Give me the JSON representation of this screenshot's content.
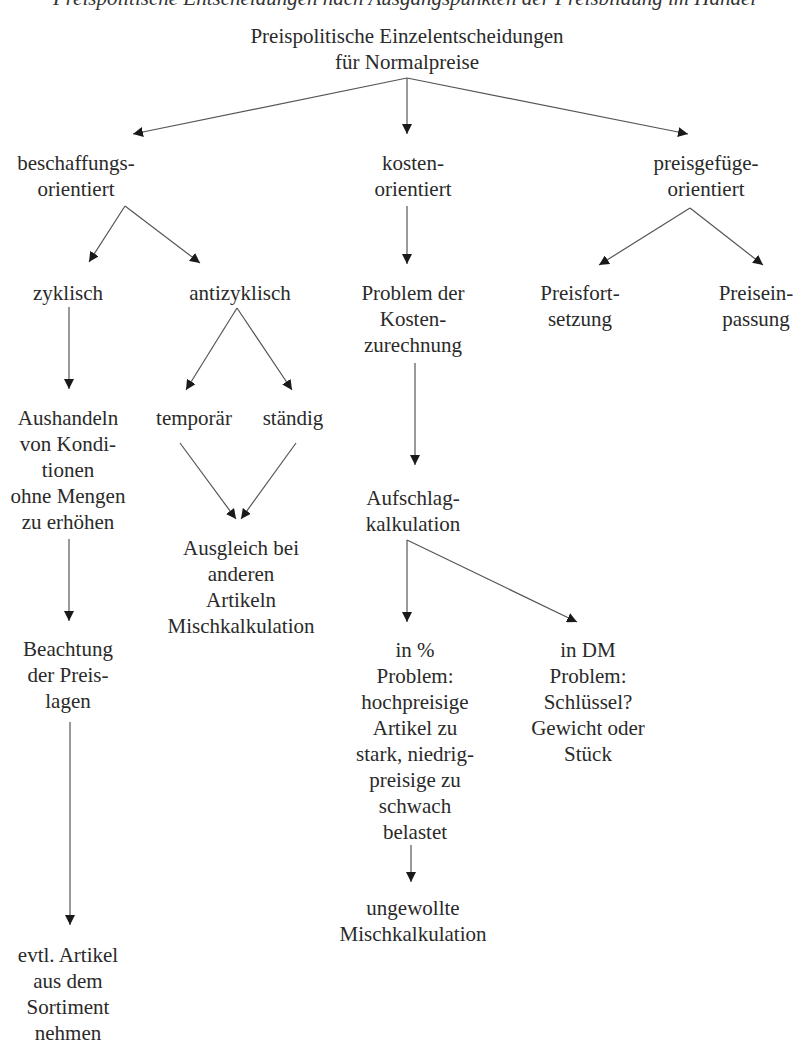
{
  "caption": "Preispolitische Entscheidungen nach Ausgangspunkten der Preisbildung im Handel",
  "root": {
    "lines": [
      "Preispolitische Einzelentscheidungen",
      "für Normalpreise"
    ]
  },
  "nodes": {
    "beschaffung": {
      "lines": [
        "beschaffungs-",
        "orientiert"
      ]
    },
    "kosten": {
      "lines": [
        "kosten-",
        "orientiert"
      ]
    },
    "preisgefuege": {
      "lines": [
        "preisgefüge-",
        "orientiert"
      ]
    },
    "zyklisch": {
      "lines": [
        "zyklisch"
      ]
    },
    "antizyklisch": {
      "lines": [
        "antizyklisch"
      ]
    },
    "problem_kosten": {
      "lines": [
        "Problem der",
        "Kosten-",
        "zurechnung"
      ]
    },
    "preisfortsetzung": {
      "lines": [
        "Preisfort-",
        "setzung"
      ]
    },
    "preiseinpassung": {
      "lines": [
        "Preisein-",
        "passung"
      ]
    },
    "aushandeln": {
      "lines": [
        "Aushandeln",
        "von Kondi-",
        "tionen",
        "ohne Mengen",
        "zu erhöhen"
      ]
    },
    "temporaer": {
      "lines": [
        "temporär"
      ]
    },
    "staendig": {
      "lines": [
        "ständig"
      ]
    },
    "aufschlag": {
      "lines": [
        "Aufschlag-",
        "kalkulation"
      ]
    },
    "ausgleich": {
      "lines": [
        "Ausgleich bei",
        "anderen",
        "Artikeln",
        "Mischkalkulation"
      ]
    },
    "beachtung": {
      "lines": [
        "Beachtung",
        "der Preis-",
        "lagen"
      ]
    },
    "in_prozent": {
      "lines": [
        "in %",
        "Problem:",
        "hochpreisige",
        "Artikel zu",
        "stark, niedrig-",
        "preisige zu",
        "schwach",
        "belastet"
      ]
    },
    "in_dm": {
      "lines": [
        "in DM",
        "Problem:",
        "Schlüssel?",
        "Gewicht oder",
        "Stück"
      ]
    },
    "ungewollte": {
      "lines": [
        "ungewollte",
        "Mischkalkulation"
      ]
    },
    "evtl": {
      "lines": [
        "evtl. Artikel",
        "aus dem",
        "Sortiment",
        "nehmen"
      ]
    }
  },
  "edges": [
    {
      "from": "root",
      "to": "beschaffung"
    },
    {
      "from": "root",
      "to": "kosten"
    },
    {
      "from": "root",
      "to": "preisgefuege"
    },
    {
      "from": "beschaffung",
      "to": "zyklisch"
    },
    {
      "from": "beschaffung",
      "to": "antizyklisch"
    },
    {
      "from": "kosten",
      "to": "problem_kosten"
    },
    {
      "from": "preisgefuege",
      "to": "preisfortsetzung"
    },
    {
      "from": "preisgefuege",
      "to": "preiseinpassung"
    },
    {
      "from": "zyklisch",
      "to": "aushandeln"
    },
    {
      "from": "antizyklisch",
      "to": "temporaer"
    },
    {
      "from": "antizyklisch",
      "to": "staendig"
    },
    {
      "from": "problem_kosten",
      "to": "aufschlag"
    },
    {
      "from": "temporaer",
      "to": "ausgleich"
    },
    {
      "from": "staendig",
      "to": "ausgleich"
    },
    {
      "from": "aushandeln",
      "to": "beachtung"
    },
    {
      "from": "aufschlag",
      "to": "in_prozent"
    },
    {
      "from": "aufschlag",
      "to": "in_dm"
    },
    {
      "from": "in_prozent",
      "to": "ungewollte"
    },
    {
      "from": "beachtung",
      "to": "evtl"
    }
  ]
}
